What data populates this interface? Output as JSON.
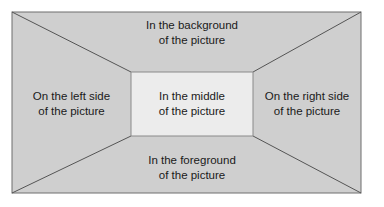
{
  "diagram": {
    "regions": {
      "top": "In the background of the picture",
      "top_line1": "In the background",
      "top_line2": "of the picture",
      "left_line1": "On the left side",
      "left_line2": "of the picture",
      "right_line1": "On the right side",
      "right_line2": "of the picture",
      "bottom_line1": "In the foreground",
      "bottom_line2": "of the picture",
      "middle_line1": "In the middle",
      "middle_line2": "of the picture"
    },
    "colors": {
      "outer_fill": "#cfcfcf",
      "inner_fill": "#ececec",
      "stroke": "#6e6e6e"
    }
  }
}
